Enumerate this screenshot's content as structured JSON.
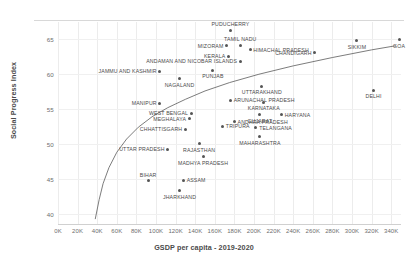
{
  "chart_data": {
    "type": "scatter",
    "title": "",
    "xlabel": "GSDP per capita - 2019-2020",
    "ylabel": "Social Progress Index",
    "xlim": [
      0,
      350000
    ],
    "ylim": [
      38.5,
      67.5
    ],
    "grid": true,
    "legend": "none",
    "xticks": [
      "0K",
      "20K",
      "40K",
      "60K",
      "80K",
      "100K",
      "120K",
      "140K",
      "160K",
      "180K",
      "200K",
      "220K",
      "240K",
      "260K",
      "280K",
      "300K",
      "320K",
      "340K"
    ],
    "xtick_values": [
      0,
      20000,
      40000,
      60000,
      80000,
      100000,
      120000,
      140000,
      160000,
      180000,
      200000,
      220000,
      240000,
      260000,
      280000,
      300000,
      320000,
      340000
    ],
    "yticks": [
      "65",
      "60",
      "55",
      "50",
      "45",
      "40"
    ],
    "ytick_values": [
      65,
      60,
      55,
      50,
      45,
      40
    ],
    "trendline": {
      "type": "logarithmic",
      "points": [
        [
          38000,
          39.2
        ],
        [
          42000,
          42.0
        ],
        [
          46000,
          44.3
        ],
        [
          52000,
          46.6
        ],
        [
          60000,
          48.8
        ],
        [
          70000,
          50.7
        ],
        [
          82000,
          52.4
        ],
        [
          96000,
          53.9
        ],
        [
          112000,
          55.2
        ],
        [
          130000,
          56.4
        ],
        [
          150000,
          57.6
        ],
        [
          175000,
          58.8
        ],
        [
          205000,
          60.0
        ],
        [
          240000,
          61.2
        ],
        [
          280000,
          62.4
        ],
        [
          320000,
          63.5
        ],
        [
          345000,
          64.1
        ]
      ]
    },
    "points": [
      {
        "label": "PUDUCHERRY",
        "x": 176000,
        "y": 66.3,
        "label_pos": "above"
      },
      {
        "label": "TAMIL NADU",
        "x": 186000,
        "y": 64.1,
        "label_pos": "above"
      },
      {
        "label": "MIZORAM",
        "x": 172000,
        "y": 64.1,
        "label_pos": "left"
      },
      {
        "label": "HIMACHAL PRADESH",
        "x": 196000,
        "y": 63.5,
        "label_pos": "right"
      },
      {
        "label": "CHANDIGARH",
        "x": 262000,
        "y": 63.1,
        "label_pos": "left"
      },
      {
        "label": "SIKKIM",
        "x": 305000,
        "y": 64.8,
        "label_pos": "below"
      },
      {
        "label": "GOA",
        "x": 348000,
        "y": 65.0,
        "label_pos": "below"
      },
      {
        "label": "KERALA",
        "x": 174000,
        "y": 62.6,
        "label_pos": "left"
      },
      {
        "label": "ANDAMAN AND NICOBAR ISLANDS",
        "x": 186000,
        "y": 61.9,
        "label_pos": "left"
      },
      {
        "label": "JAMMU AND KASHMIR",
        "x": 104000,
        "y": 60.4,
        "label_pos": "left"
      },
      {
        "label": "PUNJAB",
        "x": 158000,
        "y": 60.6,
        "label_pos": "below"
      },
      {
        "label": "NAGALAND",
        "x": 124000,
        "y": 59.4,
        "label_pos": "below"
      },
      {
        "label": "UTTARAKHAND",
        "x": 208000,
        "y": 58.3,
        "label_pos": "below"
      },
      {
        "label": "ARUNACHAL PRADESH",
        "x": 176000,
        "y": 56.3,
        "label_pos": "right"
      },
      {
        "label": "MANIPUR",
        "x": 104000,
        "y": 55.8,
        "label_pos": "left"
      },
      {
        "label": "KARNATAKA",
        "x": 210000,
        "y": 56.0,
        "label_pos": "below"
      },
      {
        "label": "WEST BENGAL",
        "x": 136000,
        "y": 54.4,
        "label_pos": "left"
      },
      {
        "label": "MEGHALAYA",
        "x": 134000,
        "y": 53.6,
        "label_pos": "left"
      },
      {
        "label": "GUJARAT",
        "x": 206000,
        "y": 54.2,
        "label_pos": "below"
      },
      {
        "label": "HARYANA",
        "x": 228000,
        "y": 54.2,
        "label_pos": "right"
      },
      {
        "label": "ANDHRA PRADESH",
        "x": 180000,
        "y": 53.2,
        "label_pos": "right"
      },
      {
        "label": "TRIPURA",
        "x": 168000,
        "y": 52.5,
        "label_pos": "right"
      },
      {
        "label": "CHHATTISGARH",
        "x": 130000,
        "y": 52.1,
        "label_pos": "left"
      },
      {
        "label": "TELANGANA",
        "x": 202000,
        "y": 52.3,
        "label_pos": "right"
      },
      {
        "label": "MAHARASHTRA",
        "x": 206000,
        "y": 51.0,
        "label_pos": "below"
      },
      {
        "label": "RAJASTHAN",
        "x": 144000,
        "y": 50.0,
        "label_pos": "below"
      },
      {
        "label": "UTTAR PRADESH",
        "x": 112000,
        "y": 49.2,
        "label_pos": "left"
      },
      {
        "label": "MADHYA PRADESH",
        "x": 148000,
        "y": 48.2,
        "label_pos": "below"
      },
      {
        "label": "BIHAR",
        "x": 92000,
        "y": 44.7,
        "label_pos": "above"
      },
      {
        "label": "ASSAM",
        "x": 128000,
        "y": 44.8,
        "label_pos": "right"
      },
      {
        "label": "JHARKHAND",
        "x": 124000,
        "y": 43.3,
        "label_pos": "below"
      },
      {
        "label": "DELHI",
        "x": 322000,
        "y": 57.7,
        "label_pos": "below"
      }
    ]
  }
}
